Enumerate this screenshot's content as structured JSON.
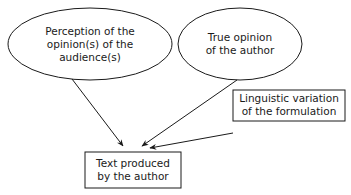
{
  "nodes": {
    "perception": {
      "shape": "ellipse",
      "lines": [
        "Perception of the",
        "opinion(s) of the",
        "audience(s)"
      ]
    },
    "true_opinion": {
      "shape": "ellipse",
      "lines": [
        "True opinion",
        "of the author"
      ]
    },
    "linguistic": {
      "shape": "rectangle",
      "lines": [
        "Linguistic variation",
        "of the formulation"
      ]
    },
    "text_produced": {
      "shape": "rectangle",
      "lines": [
        "Text produced",
        "by the author"
      ]
    }
  },
  "edges": [
    {
      "from": "perception",
      "to": "text_produced"
    },
    {
      "from": "true_opinion",
      "to": "text_produced"
    },
    {
      "from": "linguistic",
      "to": "text_produced"
    }
  ],
  "colors": {
    "stroke": "#1a1a1a",
    "background": "#ffffff"
  }
}
